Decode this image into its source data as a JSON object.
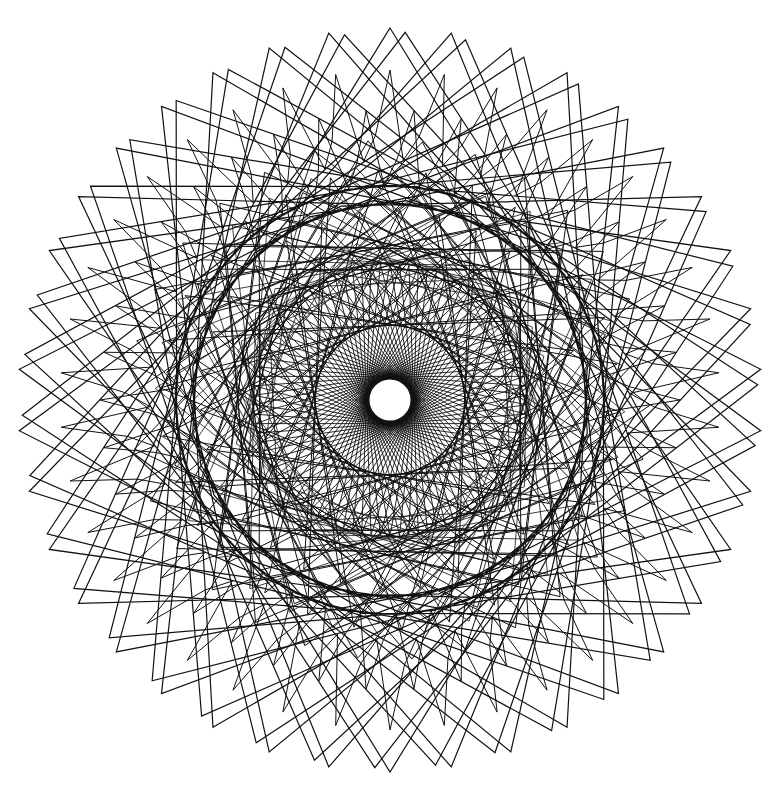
{
  "figure": {
    "background": "#ffffff",
    "ink": "#111111",
    "width": 778,
    "height": 798,
    "center": [
      390,
      400
    ],
    "center_hole_radius": 22,
    "layers": {
      "inner_disc": {
        "radius": 136,
        "points": 90,
        "skip": 40,
        "stroke_width": 0.9
      },
      "middle_ring_a": {
        "R": 260,
        "r": 100,
        "points": 60,
        "skip": 17,
        "stroke_width": 1.0
      },
      "middle_ring_b": {
        "R": 215,
        "r": 150,
        "points": 48,
        "skip": 11,
        "stroke_width": 1.0
      },
      "outer_star": {
        "R_tip": 372,
        "R_inner": 200,
        "spikes": 38,
        "skip": 7,
        "stroke_width": 1.2
      },
      "outer_kinks": {
        "R_out": 330,
        "R_in": 240,
        "count": 38,
        "stroke_width": 1.0
      }
    }
  }
}
